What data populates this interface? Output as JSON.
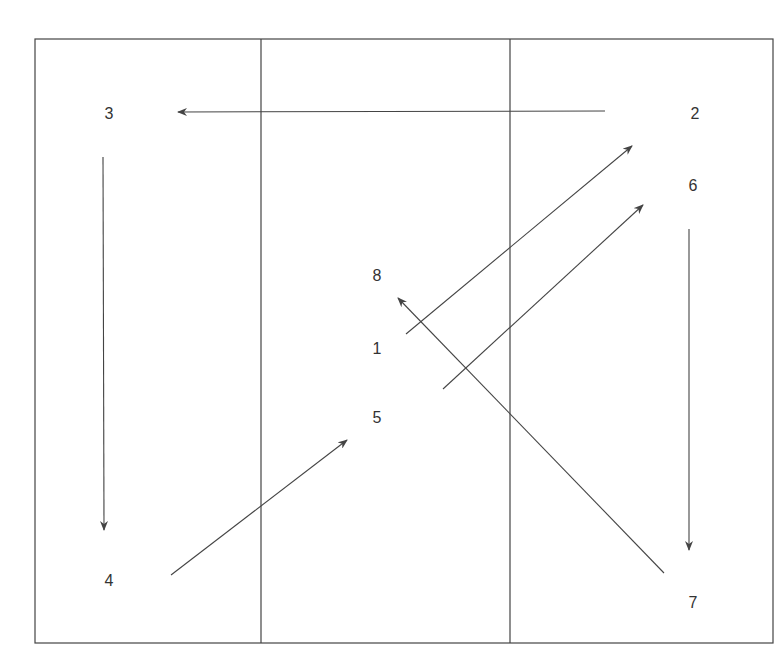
{
  "diagram": {
    "type": "movement-pattern",
    "frame": {
      "x": 35,
      "y": 39,
      "width": 738,
      "height": 604
    },
    "column_dividers": [
      261,
      510
    ],
    "colors": {
      "line": "#444444",
      "text": "#333333",
      "background": "#ffffff"
    },
    "positions": [
      {
        "id": "1",
        "label": "1",
        "x": 377,
        "y": 349
      },
      {
        "id": "2",
        "label": "2",
        "x": 695,
        "y": 114
      },
      {
        "id": "3",
        "label": "3",
        "x": 109,
        "y": 114
      },
      {
        "id": "4",
        "label": "4",
        "x": 109,
        "y": 581
      },
      {
        "id": "5",
        "label": "5",
        "x": 377,
        "y": 418
      },
      {
        "id": "6",
        "label": "6",
        "x": 693,
        "y": 186
      },
      {
        "id": "7",
        "label": "7",
        "x": 693,
        "y": 603
      },
      {
        "id": "8",
        "label": "8",
        "x": 377,
        "y": 276
      }
    ],
    "arrows": [
      {
        "from": "1",
        "to": "2",
        "x1": 406,
        "y1": 334,
        "x2": 632,
        "y2": 146
      },
      {
        "from": "2",
        "to": "3",
        "x1": 605,
        "y1": 111,
        "x2": 178,
        "y2": 112
      },
      {
        "from": "3",
        "to": "4",
        "x1": 103,
        "y1": 157,
        "x2": 104,
        "y2": 530
      },
      {
        "from": "4",
        "to": "5",
        "x1": 171,
        "y1": 575,
        "x2": 347,
        "y2": 440
      },
      {
        "from": "5",
        "to": "6",
        "x1": 443,
        "y1": 389,
        "x2": 643,
        "y2": 205
      },
      {
        "from": "6",
        "to": "7",
        "x1": 689,
        "y1": 229,
        "x2": 689,
        "y2": 550
      },
      {
        "from": "7",
        "to": "8",
        "x1": 664,
        "y1": 573,
        "x2": 398,
        "y2": 298
      }
    ]
  }
}
